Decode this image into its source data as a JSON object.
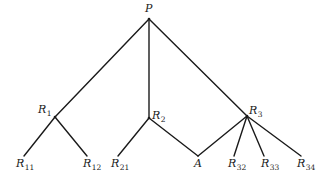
{
  "diagram": {
    "type": "tree",
    "nodes": {
      "P": {
        "base": "P",
        "sub": "",
        "x": 149,
        "y": 19
      },
      "R1": {
        "base": "R",
        "sub": "1",
        "x": 55,
        "y": 117
      },
      "R2": {
        "base": "R",
        "sub": "2",
        "x": 149,
        "y": 118
      },
      "R3": {
        "base": "R",
        "sub": "3",
        "x": 247,
        "y": 116
      },
      "R11": {
        "base": "R",
        "sub": "11",
        "x": 24,
        "y": 156
      },
      "R12": {
        "base": "R",
        "sub": "12",
        "x": 87,
        "y": 156
      },
      "R21": {
        "base": "R",
        "sub": "21",
        "x": 118,
        "y": 156
      },
      "A": {
        "base": "A",
        "sub": "",
        "x": 198,
        "y": 156
      },
      "R32": {
        "base": "R",
        "sub": "32",
        "x": 234,
        "y": 156
      },
      "R33": {
        "base": "R",
        "sub": "33",
        "x": 264,
        "y": 156
      },
      "R34": {
        "base": "R",
        "sub": "34",
        "x": 301,
        "y": 156
      }
    },
    "edges": [
      [
        "P",
        "R1"
      ],
      [
        "P",
        "R2"
      ],
      [
        "P",
        "R3"
      ],
      [
        "R1",
        "R11"
      ],
      [
        "R1",
        "R12"
      ],
      [
        "R2",
        "R21"
      ],
      [
        "R2",
        "A"
      ],
      [
        "R3",
        "A"
      ],
      [
        "R3",
        "R32"
      ],
      [
        "R3",
        "R33"
      ],
      [
        "R3",
        "R34"
      ]
    ],
    "labels": {
      "P": {
        "base": "P",
        "sub": ""
      },
      "R1": {
        "base": "R",
        "sub": "1"
      },
      "R2": {
        "base": "R",
        "sub": "2"
      },
      "R3": {
        "base": "R",
        "sub": "3"
      },
      "R11": {
        "base": "R",
        "sub": "11"
      },
      "R12": {
        "base": "R",
        "sub": "12"
      },
      "R21": {
        "base": "R",
        "sub": "21"
      },
      "A": {
        "base": "A",
        "sub": ""
      },
      "R32": {
        "base": "R",
        "sub": "32"
      },
      "R33": {
        "base": "R",
        "sub": "33"
      },
      "R34": {
        "base": "R",
        "sub": "34"
      }
    }
  }
}
